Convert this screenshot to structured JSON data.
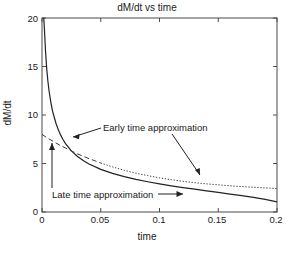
{
  "chart_data": {
    "type": "line",
    "title": "dM/dt vs time",
    "xlabel": "time",
    "ylabel": "dM/dt",
    "xlim": [
      0,
      0.2
    ],
    "ylim": [
      0,
      20
    ],
    "xticks": [
      "0",
      "0.05",
      "0.1",
      "0.15",
      "0.2"
    ],
    "xtick_values": [
      0,
      0.05,
      0.1,
      0.15,
      0.2
    ],
    "yticks": [
      "0",
      "5",
      "10",
      "15",
      "20"
    ],
    "ytick_values": [
      0,
      5,
      10,
      15,
      20
    ],
    "grid": false,
    "legend_position": "none",
    "box": true,
    "series": [
      {
        "name": "Early time approximation",
        "style": "solid",
        "color": "#222222",
        "x": [
          0.0015,
          0.002,
          0.003,
          0.004,
          0.005,
          0.006,
          0.007,
          0.008,
          0.009,
          0.01,
          0.012,
          0.014,
          0.016,
          0.018,
          0.02,
          0.025,
          0.03,
          0.035,
          0.04,
          0.05,
          0.06,
          0.07,
          0.08,
          0.09,
          0.1,
          0.11,
          0.12,
          0.13,
          0.14,
          0.15,
          0.16,
          0.17,
          0.18,
          0.19,
          0.2
        ],
        "y": [
          20.0,
          19.0,
          16.6,
          14.8,
          13.5,
          12.5,
          11.7,
          11.0,
          10.4,
          9.95,
          9.1,
          8.45,
          7.9,
          7.45,
          7.05,
          6.3,
          5.75,
          5.3,
          4.95,
          4.4,
          3.98,
          3.64,
          3.36,
          3.12,
          2.9,
          2.7,
          2.52,
          2.35,
          2.18,
          2.02,
          1.85,
          1.68,
          1.5,
          1.3,
          1.05
        ]
      },
      {
        "name": "Late time approximation",
        "style": "dashed-to-dotted",
        "color": "#3a3a3a",
        "x": [
          0.0,
          0.005,
          0.01,
          0.015,
          0.02,
          0.025,
          0.03,
          0.035,
          0.04,
          0.045,
          0.05,
          0.06,
          0.07,
          0.08,
          0.09,
          0.1,
          0.11,
          0.12,
          0.13,
          0.14,
          0.15,
          0.16,
          0.17,
          0.18,
          0.19,
          0.2
        ],
        "y": [
          8.0,
          7.6,
          7.25,
          6.9,
          6.6,
          6.3,
          6.0,
          5.75,
          5.5,
          5.28,
          5.05,
          4.65,
          4.3,
          4.0,
          3.75,
          3.52,
          3.33,
          3.16,
          3.02,
          2.9,
          2.8,
          2.7,
          2.62,
          2.55,
          2.48,
          2.42
        ]
      }
    ],
    "annotations": [
      {
        "name": "early-time-approximation",
        "text": "Early time approximation",
        "arrows": [
          "points left-down to solid curve",
          "points down-right to dotted curve"
        ]
      },
      {
        "name": "late-time-approximation",
        "text": "Late time approximation",
        "arrows": [
          "vertical arrow up to dashed curve",
          "horizontal arrow right to solid curve"
        ]
      }
    ]
  }
}
